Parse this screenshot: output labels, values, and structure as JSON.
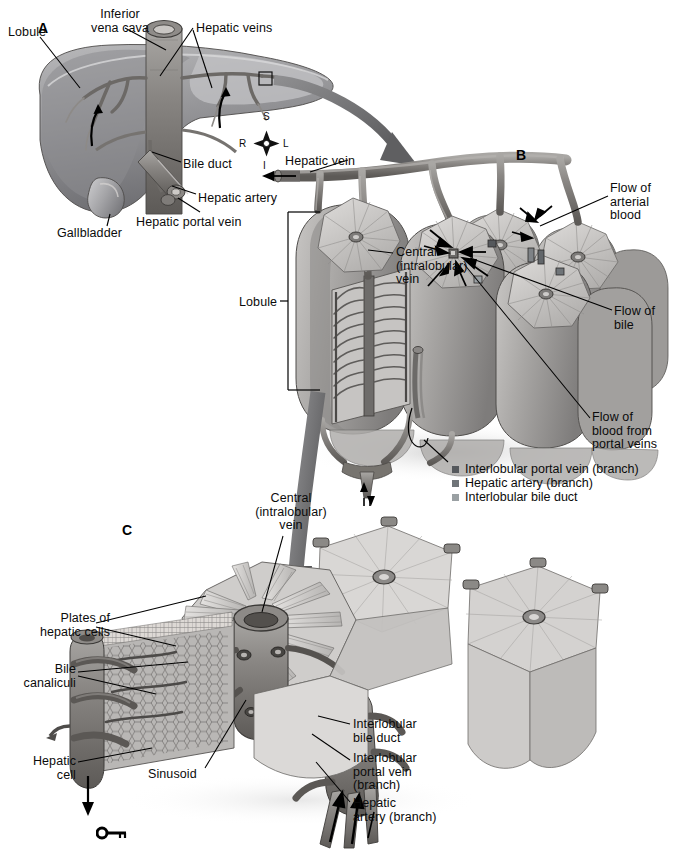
{
  "figure": {
    "background_color": "#ffffff",
    "ink_color": "#0b0b0b"
  },
  "panels": [
    {
      "id": "A",
      "label": "A",
      "x": 38,
      "y": 20
    },
    {
      "id": "B",
      "label": "B",
      "x": 516,
      "y": 147
    },
    {
      "id": "C",
      "label": "C",
      "x": 122,
      "y": 522
    }
  ],
  "panel_a": {
    "orientation_compass": {
      "superior": "S",
      "inferior": "I",
      "right": "R",
      "left": "L"
    },
    "labels": [
      {
        "name": "lobule",
        "text": "Lobule",
        "x": 8,
        "y": 26,
        "align": "left"
      },
      {
        "name": "inferior-vena-cava",
        "text": "Inferior\nvena cava",
        "x": 70,
        "y": 8,
        "align": "center"
      },
      {
        "name": "hepatic-veins",
        "text": "Hepatic veins",
        "x": 196,
        "y": 22,
        "align": "left"
      },
      {
        "name": "bile-duct",
        "text": "Bile duct",
        "x": 183,
        "y": 158,
        "align": "left"
      },
      {
        "name": "hepatic-artery",
        "text": "Hepatic artery",
        "x": 198,
        "y": 192,
        "align": "left"
      },
      {
        "name": "hepatic-portal-vein",
        "text": "Hepatic portal vein",
        "x": 136,
        "y": 216,
        "align": "left"
      },
      {
        "name": "gallbladder",
        "text": "Gallbladder",
        "x": 57,
        "y": 227,
        "align": "left"
      }
    ]
  },
  "panel_b": {
    "labels": [
      {
        "name": "hepatic-vein",
        "text": "Hepatic vein",
        "x": 285,
        "y": 155,
        "align": "left"
      },
      {
        "name": "lobule",
        "text": "Lobule",
        "x": 239,
        "y": 296,
        "align": "left"
      },
      {
        "name": "central-intralobular-vein",
        "text": "Central\n(intralobular)\nvein",
        "x": 396,
        "y": 246,
        "align": "left"
      },
      {
        "name": "flow-of-arterial-blood",
        "text": "Flow of\narterial\nblood",
        "x": 610,
        "y": 182,
        "align": "left"
      },
      {
        "name": "flow-of-bile",
        "text": "Flow of\nbile",
        "x": 614,
        "y": 305,
        "align": "left"
      },
      {
        "name": "flow-of-blood-portal-veins",
        "text": "Flow of\nblood from\nportal veins",
        "x": 592,
        "y": 411,
        "align": "left"
      }
    ],
    "legend": {
      "items": [
        {
          "name": "interlobular-portal-vein",
          "label": "Interlobular portal vein (branch)",
          "color": "#55585c"
        },
        {
          "name": "hepatic-artery-branch",
          "label": "Hepatic artery (branch)",
          "color": "#6f7478"
        },
        {
          "name": "interlobular-bile-duct",
          "label": "Interlobular bile duct",
          "color": "#9aa0a3"
        }
      ]
    }
  },
  "panel_c": {
    "labels": [
      {
        "name": "central-intralobular-vein",
        "text": "Central\n(intralobular)\nvein",
        "x": 243,
        "y": 492,
        "align": "center"
      },
      {
        "name": "plates-of-hepatic-cells",
        "text": "Plates of\nhepatic cells",
        "x": 40,
        "y": 612,
        "align": "right"
      },
      {
        "name": "bile-canaliculi",
        "text": "Bile\ncanaliculi",
        "x": 18,
        "y": 663,
        "align": "right"
      },
      {
        "name": "hepatic-cell",
        "text": "Hepatic\ncell",
        "x": 25,
        "y": 755,
        "align": "right"
      },
      {
        "name": "sinusoid",
        "text": "Sinusoid",
        "x": 148,
        "y": 768,
        "align": "left"
      },
      {
        "name": "interlobular-bile-duct",
        "text": "Interlobular\nbile duct",
        "x": 353,
        "y": 718,
        "align": "left"
      },
      {
        "name": "interlobular-portal-vein",
        "text": "Interlobular\nportal vein\n(branch)",
        "x": 353,
        "y": 752,
        "align": "left"
      },
      {
        "name": "hepatic-artery-branch",
        "text": "Hepatic\nartery (branch)",
        "x": 353,
        "y": 797,
        "align": "left"
      }
    ]
  },
  "footer": {
    "key_icon": "key-icon"
  }
}
